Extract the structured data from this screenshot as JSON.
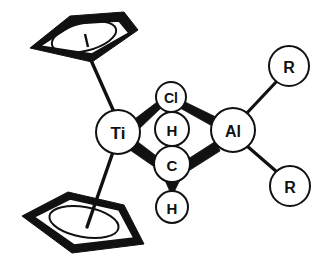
{
  "figure": {
    "kind": "chemical-structure-diagram",
    "background_color": "#ffffff",
    "ink_color": "#111111"
  },
  "atoms": {
    "ti": {
      "label": "Ti",
      "cx": 118,
      "cy": 132,
      "r": 22,
      "font_size": 17
    },
    "cl": {
      "label": "Cl",
      "cx": 171,
      "cy": 97,
      "r": 15,
      "font_size": 14
    },
    "h_top": {
      "label": "H",
      "cx": 172,
      "cy": 129,
      "r": 17,
      "font_size": 15
    },
    "c": {
      "label": "C",
      "cx": 172,
      "cy": 164,
      "r": 18,
      "font_size": 15
    },
    "h_bottom": {
      "label": "H",
      "cx": 172,
      "cy": 207,
      "r": 16,
      "font_size": 15
    },
    "al": {
      "label": "Al",
      "cx": 233,
      "cy": 130,
      "r": 22,
      "font_size": 16
    },
    "r_top": {
      "label": "R",
      "cx": 289,
      "cy": 66,
      "r": 20,
      "font_size": 16
    },
    "r_bottom": {
      "label": "R",
      "cx": 290,
      "cy": 186,
      "r": 20,
      "font_size": 16
    }
  },
  "ligands": {
    "cp_top": {
      "name": "cyclopentadienyl-ring-top",
      "outer_points": "30,48 70,16 124,12 138,30 92,62",
      "inner_points": "40,46 74,24 119,21 129,33 92,54",
      "ellipse": {
        "cx": 84,
        "cy": 37,
        "rx": 33,
        "ry": 14,
        "rotate": -14
      },
      "stub": "84,37 88,46"
    },
    "cp_bottom": {
      "name": "cyclopentadienyl-ring-bottom",
      "outer_points": "22,216 68,192 124,205 144,244 72,253",
      "inner_points": "34,217 70,199 119,210 134,238 74,245",
      "ellipse": {
        "cx": 84,
        "cy": 222,
        "rx": 35,
        "ry": 15,
        "rotate": 10
      }
    }
  },
  "bonds": [
    {
      "name": "bond-cp-top-to-ti",
      "kind": "line",
      "from": "cp-top",
      "to": "Ti",
      "path": "M 90,60 L 114,111"
    },
    {
      "name": "bond-ti-to-cp-bottom",
      "kind": "line",
      "from": "Ti",
      "to": "cp-bottom",
      "path": "M 113,153 L 88,224"
    },
    {
      "name": "bond-ti-to-cl",
      "kind": "tapered-wedge",
      "from": "Ti",
      "to": "Cl",
      "points": "135,121 159,101 160,106 138,128"
    },
    {
      "name": "bond-cl-to-al",
      "kind": "tapered-wedge",
      "from": "Cl",
      "to": "Al",
      "points": "183,102 216,120 213,126 182,107"
    },
    {
      "name": "bond-ti-to-c",
      "kind": "tapered-wedge",
      "from": "Ti",
      "to": "C",
      "points": "133,142 157,160 155,167 131,150"
    },
    {
      "name": "bond-c-to-al",
      "kind": "tapered-wedge",
      "from": "C",
      "to": "Al",
      "points": "189,161 215,143 218,150 190,168"
    },
    {
      "name": "bond-c-to-h-top",
      "kind": "solid-wedge",
      "points": "172,141 180,154 164,154"
    },
    {
      "name": "bond-c-to-h-bottom",
      "kind": "solid-wedge",
      "points": "172,194 164,177 181,177"
    },
    {
      "name": "bond-al-to-r-top",
      "kind": "line",
      "path": "M 245,113 L 277,80"
    },
    {
      "name": "bond-al-to-r-bottom",
      "kind": "line",
      "path": "M 246,147 L 277,173"
    }
  ],
  "caption": ""
}
